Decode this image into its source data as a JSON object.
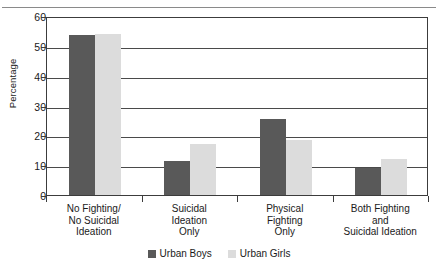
{
  "figure": {
    "clipped_title_fragment": "",
    "yaxis_title": "Percentage"
  },
  "chart_data": {
    "type": "bar",
    "title": "",
    "xlabel": "",
    "ylabel": "Percentage",
    "ylim": [
      0,
      60
    ],
    "ytick_step": 10,
    "yticks": [
      0,
      10,
      20,
      30,
      40,
      50,
      60
    ],
    "ytick_labels": [
      "0",
      "10",
      "20",
      "30",
      "40",
      "50",
      "60"
    ],
    "grid": true,
    "legend_position": "bottom-center",
    "categories": [
      "No Fighting/\nNo Suicidal\nIdeation",
      "Suicidal\nIdeation\nOnly",
      "Physical\nFighting\nOnly",
      "Both Fighting\nand\nSuicidal Ideation"
    ],
    "category_lines": [
      [
        "No Fighting/",
        "No Suicidal",
        "Ideation"
      ],
      [
        "Suicidal",
        "Ideation",
        "Only"
      ],
      [
        "Physical",
        "Fighting",
        "Only"
      ],
      [
        "Both Fighting",
        "and",
        "Suicidal Ideation"
      ]
    ],
    "series": [
      {
        "name": "Urban Boys",
        "color": "#595959",
        "values": [
          53.5,
          11.5,
          25.5,
          9.0
        ]
      },
      {
        "name": "Urban Girls",
        "color": "#dcdcdc",
        "values": [
          54.0,
          17.0,
          18.5,
          12.0
        ]
      }
    ]
  },
  "legend": {
    "items": [
      {
        "label": "Urban Boys",
        "color": "#595959"
      },
      {
        "label": "Urban Girls",
        "color": "#dcdcdc"
      }
    ]
  },
  "colors": {
    "urban_boys": "#595959",
    "urban_girls": "#dcdcdc",
    "axis": "#3c3c3c",
    "gridline": "#4a4a4a",
    "background": "#ffffff"
  }
}
